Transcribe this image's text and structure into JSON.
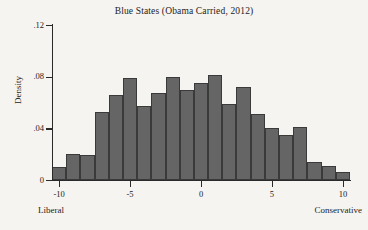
{
  "chart_data": {
    "type": "bar",
    "title": "Blue States (Obama Carried, 2012)",
    "xlabel": "",
    "ylabel": "Density",
    "xlim": [
      -10.5,
      10.5
    ],
    "ylim": [
      0,
      0.12
    ],
    "grid": false,
    "legend": null,
    "bin_width": 1.0,
    "x_tick_labels": [
      "-10",
      "-5",
      "0",
      "5",
      "10"
    ],
    "x_tick_values": [
      -10,
      -5,
      0,
      5,
      10
    ],
    "y_tick_labels": [
      "0",
      ".04",
      ".08",
      ".12"
    ],
    "y_tick_values": [
      0,
      0.04,
      0.08,
      0.12
    ],
    "axis_end_labels": {
      "left": "Liberal",
      "right": "Conservative"
    },
    "bin_centers": [
      -10,
      -9,
      -8,
      -7,
      -6,
      -5,
      -4,
      -3,
      -2,
      -1,
      0,
      1,
      2,
      3,
      4,
      5,
      6,
      7,
      8,
      9,
      10
    ],
    "values": [
      0.01,
      0.02,
      0.019,
      0.053,
      0.066,
      0.079,
      0.057,
      0.067,
      0.08,
      0.07,
      0.075,
      0.081,
      0.059,
      0.072,
      0.051,
      0.04,
      0.035,
      0.041,
      0.014,
      0.011,
      0.006
    ],
    "colors": {
      "bar_fill": "#656565",
      "bar_edge": "#3a3a3a",
      "axis": "#2a2a2a",
      "background": "#f6f4f1",
      "text": "#232323"
    }
  }
}
